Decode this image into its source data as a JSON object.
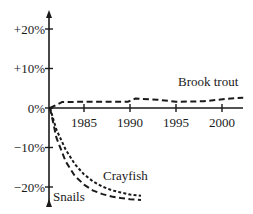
{
  "chart_data": {
    "type": "line",
    "title": "",
    "xlabel": "",
    "ylabel": "",
    "x_ticks": [
      1985,
      1990,
      1995,
      2000
    ],
    "x_tick_labels": [
      "1985",
      "1990",
      "1995",
      "2000"
    ],
    "y_ticks": [
      20,
      10,
      0,
      -10,
      -20
    ],
    "y_tick_labels": [
      "+20%",
      "+10%",
      "0%",
      "−10%",
      "−20%"
    ],
    "xlim": [
      1981.3,
      2003.5
    ],
    "ylim": [
      -24,
      24
    ],
    "grid": false,
    "legend": "inline labels",
    "series": [
      {
        "name": "Brook trout",
        "style": "dashed",
        "x": [
          1981.3,
          1982.6,
          1985,
          1989.8,
          1990.6,
          1993,
          1995,
          1998,
          2000.5,
          2002.3
        ],
        "values": [
          0,
          1.5,
          1.6,
          1.6,
          2.4,
          2.1,
          1.6,
          1.7,
          2.3,
          2.6
        ]
      },
      {
        "name": "Crayfish",
        "style": "dotted",
        "x": [
          1981.3,
          1982,
          1983,
          1984,
          1985,
          1986,
          1987,
          1988,
          1989,
          1990,
          1991.2
        ],
        "values": [
          0,
          -5.5,
          -10.5,
          -14.2,
          -16.8,
          -18.6,
          -19.9,
          -20.8,
          -21.4,
          -21.9,
          -22.2
        ]
      },
      {
        "name": "Snails",
        "style": "dashed",
        "x": [
          1981.3,
          1982,
          1983,
          1984,
          1985,
          1986,
          1987,
          1988,
          1989,
          1990,
          1991.2
        ],
        "values": [
          0,
          -7.5,
          -13.5,
          -17.2,
          -19.4,
          -20.9,
          -21.8,
          -22.4,
          -22.8,
          -23.1,
          -23.3
        ]
      }
    ],
    "annotations": [
      "Brook trout",
      "Crayfish",
      "Snails"
    ]
  }
}
